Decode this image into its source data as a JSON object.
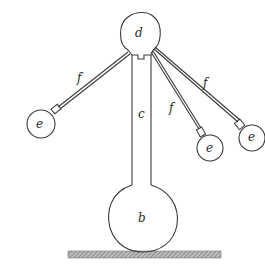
{
  "figure": {
    "labels": {
      "top_sphere": "d",
      "stem": "c",
      "bottom_bulb": "b",
      "ball_left": "e",
      "ball_middle_right": "e",
      "ball_far_right": "e",
      "arm_left": "f",
      "arm_middle": "f",
      "arm_right": "f"
    },
    "colors": {
      "ink": "#3a3a3a",
      "background": "#ffffff",
      "base_hatch": "#8a8a8a"
    }
  }
}
